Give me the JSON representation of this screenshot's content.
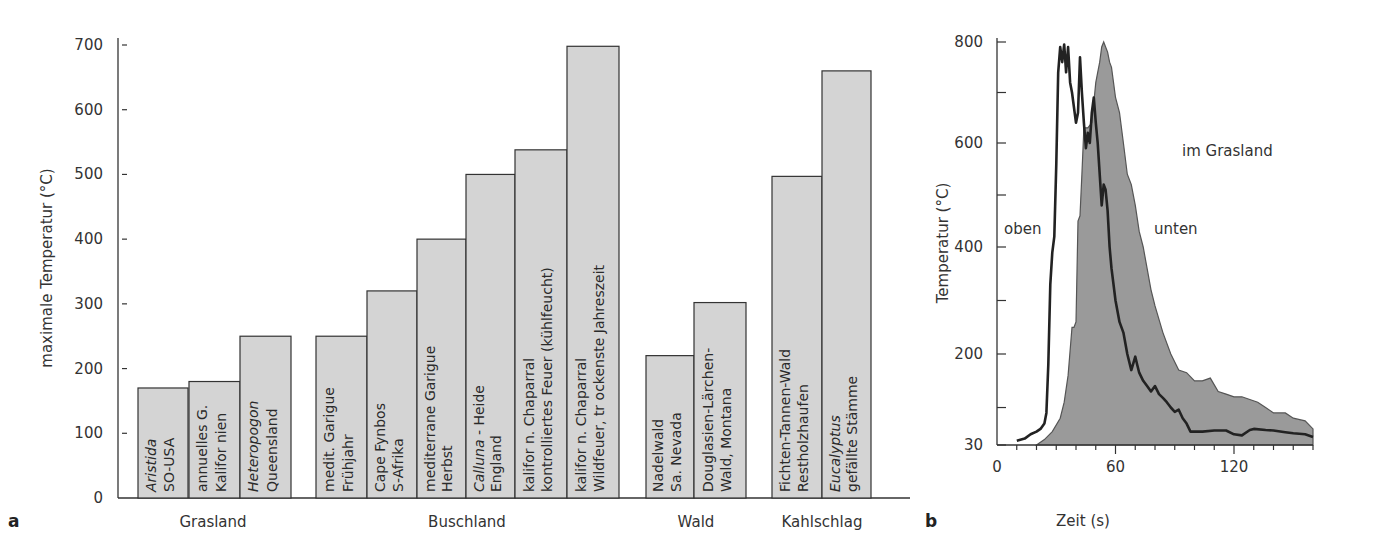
{
  "chart_data": [
    {
      "panel": "a",
      "type": "bar",
      "title": "",
      "xlabel": "",
      "ylabel": "maximale Temperatur (°C)",
      "ylim": [
        0,
        700
      ],
      "yticks": [
        0,
        100,
        200,
        300,
        400,
        500,
        600,
        700
      ],
      "grid": false,
      "bar_color": "#d4d4d4",
      "groups": [
        {
          "label": "Grasland",
          "bars": [
            {
              "line1": "Aristida",
              "line1_italic": true,
              "line2": "SO-USA",
              "value": 170
            },
            {
              "line1": "annuelles G.",
              "line1_italic": false,
              "line2": "Kalifor nien",
              "value": 180
            },
            {
              "line1": "Heteropogon",
              "line1_italic": true,
              "line2": "Queensland",
              "value": 250
            }
          ]
        },
        {
          "label": "Buschland",
          "bars": [
            {
              "line1": "medit. Garigue",
              "line1_italic": false,
              "line2": "Frühjahr",
              "value": 250
            },
            {
              "line1": "Cape Fynbos",
              "line1_italic": false,
              "line2": "S-Afrika",
              "value": 320
            },
            {
              "line1": "mediterrane Garigue",
              "line1_italic": false,
              "line2": "Herbst",
              "value": 400
            },
            {
              "line1": "Calluna",
              "line1_italic": true,
              "line1_suffix": " - Heide",
              "line2": "England",
              "value": 500
            },
            {
              "line1": "kalifor n. Chaparral",
              "line1_italic": false,
              "line2": "kontrolliertes Feuer (kühlfeucht)",
              "value": 538
            },
            {
              "line1": "kalifor n. Chaparral",
              "line1_italic": false,
              "line2": "Wildfeuer, tr ockenste Jahreszeit",
              "value": 698
            }
          ]
        },
        {
          "label": "Wald",
          "bars": [
            {
              "line1": "Nadelwald",
              "line1_italic": false,
              "line2": "Sa. Nevada",
              "value": 220
            },
            {
              "line1": "Douglasien-Lärchen-",
              "line1_italic": false,
              "line2": "Wald, Montana",
              "value": 302
            }
          ]
        },
        {
          "label": "Kahlschlag",
          "bars": [
            {
              "line1": "Fichten-Tannen-Wald",
              "line1_italic": false,
              "line2": "Restholzhaufen",
              "value": 497
            },
            {
              "line1": "Eucalyptus",
              "line1_italic": true,
              "line2": "gefällte Stämme",
              "value": 660
            }
          ]
        }
      ]
    },
    {
      "panel": "b",
      "type": "area",
      "title": "",
      "xlabel": "Zeit (s)",
      "ylabel": "Temperatur (°C)",
      "xlim": [
        0,
        160
      ],
      "ylim": [
        30,
        800
      ],
      "xticks": [
        0,
        60,
        120
      ],
      "yticks": [
        30,
        200,
        400,
        600,
        800
      ],
      "grid": false,
      "annotations": [
        "oben",
        "unten",
        "im Grasland"
      ],
      "fill_color": "#9a9a9a",
      "series": [
        {
          "name": "oben",
          "style": "line",
          "x": [
            10,
            14,
            17,
            20,
            22,
            24,
            25,
            26,
            27,
            28,
            29,
            30,
            31,
            32,
            33,
            34,
            35,
            36,
            37,
            38,
            40,
            41,
            42,
            43,
            44,
            45,
            46,
            47,
            48,
            49,
            50,
            51,
            52,
            53,
            54,
            55,
            56,
            57,
            58,
            59,
            60,
            62,
            64,
            66,
            68,
            70,
            71,
            72,
            74,
            76,
            78,
            80,
            82,
            84,
            86,
            88,
            90,
            92,
            94,
            96,
            98,
            100,
            104,
            110,
            116,
            120,
            124,
            128,
            130,
            136,
            140,
            146,
            150,
            156,
            160
          ],
          "y": [
            38,
            42,
            50,
            55,
            60,
            70,
            90,
            180,
            330,
            390,
            420,
            560,
            740,
            790,
            760,
            795,
            740,
            790,
            720,
            700,
            640,
            660,
            770,
            700,
            640,
            590,
            620,
            600,
            660,
            690,
            640,
            600,
            540,
            480,
            520,
            510,
            470,
            400,
            360,
            330,
            300,
            260,
            240,
            200,
            170,
            195,
            180,
            165,
            150,
            140,
            130,
            140,
            125,
            118,
            110,
            100,
            92,
            96,
            80,
            70,
            55,
            55,
            55,
            57,
            57,
            50,
            48,
            58,
            60,
            58,
            57,
            54,
            52,
            50,
            45
          ]
        },
        {
          "name": "unten",
          "style": "filled",
          "x": [
            20,
            24,
            28,
            32,
            34,
            36,
            38,
            39,
            40,
            41,
            42,
            43,
            44,
            46,
            48,
            50,
            51,
            52,
            53,
            54,
            55,
            56,
            57,
            58,
            59,
            60,
            62,
            64,
            66,
            68,
            70,
            72,
            74,
            76,
            78,
            80,
            84,
            88,
            92,
            96,
            100,
            104,
            108,
            112,
            116,
            120,
            124,
            128,
            132,
            136,
            140,
            146,
            150,
            156,
            160
          ],
          "y": [
            30,
            40,
            55,
            80,
            110,
            160,
            250,
            250,
            260,
            450,
            460,
            540,
            630,
            630,
            640,
            720,
            740,
            760,
            790,
            800,
            790,
            780,
            760,
            750,
            720,
            690,
            660,
            600,
            540,
            520,
            480,
            430,
            400,
            360,
            320,
            290,
            240,
            200,
            170,
            165,
            150,
            150,
            155,
            130,
            125,
            120,
            120,
            115,
            110,
            100,
            90,
            90,
            80,
            75,
            60
          ]
        }
      ]
    }
  ],
  "labels": {
    "panel_a_letter": "a",
    "panel_b_letter": "b",
    "ylabel_a": "maximale Temperatur (°C)",
    "ylabel_b": "Temperatur (°C)",
    "xlabel_b": "Zeit (s)",
    "annot_oben": "oben",
    "annot_unten": "unten",
    "annot_grasland": "im Grasland"
  }
}
